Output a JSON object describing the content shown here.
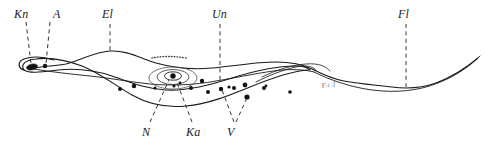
{
  "figure": {
    "background_color": "#ffffff",
    "ink_color": "#1a1a1a",
    "faint_ink_color": "#6d6d6d",
    "width": 485,
    "height": 147
  },
  "labels": {
    "kn": "Kn",
    "a": "A",
    "el": "El",
    "un": "Un",
    "fl": "Fl",
    "n": "N",
    "ka": "Ka",
    "v": "V",
    "faint_annotation": "F.c.f"
  },
  "label_positions": {
    "top": [
      {
        "text": "Kn",
        "x": 14,
        "y": 8,
        "leader_x": 30,
        "leader_y1": 22,
        "leader_y2": 66
      },
      {
        "text": "A",
        "x": 53,
        "y": 8,
        "leader_x": 52,
        "leader_y1": 22,
        "leader_y2": 70
      },
      {
        "text": "El",
        "x": 102,
        "y": 8,
        "leader_x": 110,
        "leader_y1": 22,
        "leader_y2": 54
      },
      {
        "text": "Un",
        "x": 212,
        "y": 8,
        "leader_x": 220,
        "leader_y1": 22,
        "leader_y2": 90
      },
      {
        "text": "Fl",
        "x": 398,
        "y": 8,
        "leader_x": 406,
        "leader_y1": 22,
        "leader_y2": 90
      }
    ],
    "bottom": [
      {
        "text": "N",
        "x": 142,
        "y": 126
      },
      {
        "text": "Ka",
        "x": 186,
        "y": 126
      },
      {
        "text": "V",
        "x": 227,
        "y": 126
      }
    ]
  },
  "anatomy": {
    "parts": [
      {
        "code": "Kn",
        "name": "kinetoplast",
        "shape": "elongate-dark-blob"
      },
      {
        "code": "A",
        "name": "blepharoplast-granule",
        "shape": "small-dot"
      },
      {
        "code": "El",
        "name": "undulating-membrane-edge-flagellum",
        "shape": "wavy-line"
      },
      {
        "code": "Un",
        "name": "undulating-membrane",
        "shape": "wavy-band"
      },
      {
        "code": "Fl",
        "name": "free-flagellum",
        "shape": "tapering-line"
      },
      {
        "code": "N",
        "name": "nucleus",
        "shape": "concentric-ellipses"
      },
      {
        "code": "Ka",
        "name": "karyosome",
        "shape": "central-dot"
      },
      {
        "code": "V",
        "name": "volutin-granules",
        "shape": "dots"
      }
    ]
  },
  "granules": {
    "count": 16,
    "points": [
      {
        "x": 120,
        "y": 89,
        "r": 2.0
      },
      {
        "x": 134,
        "y": 86,
        "r": 2.2
      },
      {
        "x": 155,
        "y": 88,
        "r": 1.5
      },
      {
        "x": 191,
        "y": 88,
        "r": 2.0
      },
      {
        "x": 202,
        "y": 81,
        "r": 2.2
      },
      {
        "x": 208,
        "y": 92,
        "r": 2.0
      },
      {
        "x": 221,
        "y": 89,
        "r": 2.2
      },
      {
        "x": 229,
        "y": 87,
        "r": 1.6
      },
      {
        "x": 234,
        "y": 88,
        "r": 2.0
      },
      {
        "x": 245,
        "y": 85,
        "r": 2.4
      },
      {
        "x": 247,
        "y": 97,
        "r": 2.6
      },
      {
        "x": 264,
        "y": 88,
        "r": 2.0
      },
      {
        "x": 266,
        "y": 87,
        "r": 1.4
      },
      {
        "x": 290,
        "y": 92,
        "r": 1.8
      },
      {
        "x": 174,
        "y": 86,
        "r": 1.5
      },
      {
        "x": 180,
        "y": 83,
        "r": 1.4
      }
    ]
  },
  "nucleus": {
    "center_x": 173,
    "center_y": 78,
    "outer_rx": 24,
    "outer_ry": 11,
    "mid_rx": 16,
    "mid_ry": 7.5,
    "inner_rx": 8,
    "inner_ry": 4,
    "karyosome_r": 2.6
  },
  "kinetoplast": {
    "cx": 32,
    "cy": 67,
    "rx": 5.5,
    "ry": 2.8,
    "rotation": -12
  },
  "blepharoplast": {
    "cx": 45,
    "cy": 66,
    "r": 2.2
  }
}
